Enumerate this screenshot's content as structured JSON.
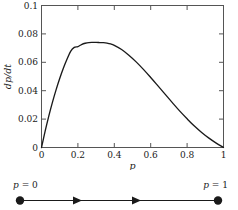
{
  "figure": {
    "background_color": "#ffffff",
    "ink_color": "#1a1a1a",
    "frame_color": "#555555"
  },
  "chart_data": {
    "type": "line",
    "title": "",
    "xlabel": "p",
    "ylabel": "dp/dt",
    "xlim": [
      0,
      1
    ],
    "ylim": [
      0,
      0.1
    ],
    "grid": false,
    "legend": null,
    "xticks": [
      0,
      0.2,
      0.4,
      0.6,
      0.8,
      1
    ],
    "xticklabels": [
      "0",
      "0.2",
      "0.4",
      "0.6",
      "0.8",
      "1"
    ],
    "yticks": [
      0,
      0.02,
      0.04,
      0.06,
      0.08,
      0.1
    ],
    "yticklabels": [
      "0",
      "0.02",
      "0.04",
      "0.06",
      "0.08",
      "0.1"
    ],
    "series": [
      {
        "name": "dp/dt",
        "x": [
          0.0,
          0.02,
          0.04,
          0.06,
          0.08,
          0.1,
          0.12,
          0.14,
          0.16,
          0.18,
          0.2,
          0.22,
          0.24,
          0.26,
          0.28,
          0.3,
          0.32,
          0.34,
          0.36,
          0.38,
          0.4,
          0.44,
          0.48,
          0.52,
          0.56,
          0.6,
          0.64,
          0.68,
          0.72,
          0.76,
          0.8,
          0.84,
          0.88,
          0.92,
          0.96,
          1.0
        ],
        "y": [
          0.0,
          0.0115,
          0.0221,
          0.0318,
          0.0406,
          0.0486,
          0.0558,
          0.0621,
          0.0677,
          0.0705,
          0.0711,
          0.0725,
          0.0734,
          0.0739,
          0.074,
          0.074,
          0.0739,
          0.0738,
          0.0735,
          0.0729,
          0.0719,
          0.069,
          0.065,
          0.0603,
          0.055,
          0.0493,
          0.0434,
          0.0374,
          0.0314,
          0.0256,
          0.0202,
          0.0151,
          0.0106,
          0.0066,
          0.0031,
          0.0
        ]
      }
    ],
    "peak": {
      "x": 0.33,
      "y": 0.074
    }
  },
  "phase_line": {
    "left_label_p": "p",
    "left_label_eq": " = 0",
    "right_label_p": "p",
    "right_label_eq": " = 1",
    "left_value": 0,
    "right_value": 1,
    "arrow_direction": "right",
    "arrow_count": 2,
    "endpoint_style": "filled-circle"
  }
}
